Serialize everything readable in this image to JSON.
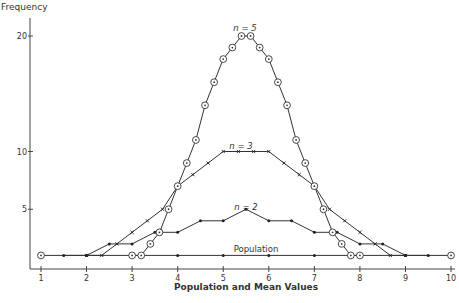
{
  "chart_data": {
    "type": "line",
    "title": "",
    "xlabel": "Population and Mean Values",
    "ylabel": "Frequency",
    "xlim": [
      1,
      10
    ],
    "ylim": [
      0,
      20
    ],
    "x_ticks": [
      1,
      2,
      3,
      4,
      5,
      6,
      7,
      8,
      9,
      10
    ],
    "y_ticks": [
      5,
      10,
      15,
      20
    ],
    "grid": false,
    "legend": "inline labels",
    "series": [
      {
        "name": "Population",
        "marker": "circle-dot",
        "x": [
          1,
          2,
          3,
          4,
          5,
          6,
          7,
          8,
          9,
          10
        ],
        "y": [
          1,
          1,
          1,
          1,
          1,
          1,
          1,
          1,
          1,
          1
        ],
        "label": "Population"
      },
      {
        "name": "n = 2",
        "marker": "dot",
        "x": [
          1.5,
          2,
          2.5,
          3,
          3.5,
          4,
          4.5,
          5,
          5.5,
          6,
          6.5,
          7,
          7.5,
          8,
          8.5,
          9,
          9.5
        ],
        "y": [
          1,
          1,
          2,
          2,
          3,
          3,
          4,
          4,
          5,
          4,
          4,
          3,
          3,
          2,
          2,
          1,
          1
        ],
        "label": "n = 2"
      },
      {
        "name": "n = 3",
        "marker": "cross",
        "x": [
          2,
          2.333,
          2.667,
          3,
          3.333,
          3.667,
          4,
          4.333,
          4.667,
          5,
          5.333,
          5.667,
          6,
          6.333,
          6.667,
          7,
          7.333,
          7.667,
          8,
          8.333,
          8.667,
          9
        ],
        "y": [
          1,
          1,
          2,
          3,
          4,
          5,
          7,
          8,
          9,
          10,
          10,
          10,
          10,
          9,
          8,
          7,
          5,
          4,
          3,
          2,
          1,
          1
        ],
        "label": "n = 3"
      },
      {
        "name": "n = 5",
        "marker": "circle",
        "x": [
          3,
          3.2,
          3.4,
          3.6,
          3.8,
          4,
          4.2,
          4.4,
          4.6,
          4.8,
          5,
          5.2,
          5.4,
          5.6,
          5.8,
          6,
          6.2,
          6.4,
          6.6,
          6.8,
          7,
          7.2,
          7.4,
          7.6,
          7.8,
          8
        ],
        "y": [
          1,
          1,
          2,
          3,
          5,
          7,
          9,
          11,
          14,
          16,
          18,
          19,
          20,
          20,
          19,
          18,
          16,
          14,
          11,
          9,
          7,
          5,
          3,
          2,
          1,
          1
        ],
        "label": "n = 5"
      }
    ]
  },
  "labels": {
    "ylabel": "Frequency",
    "xlabel": "Population and Mean Values",
    "population": "Population",
    "n2": "n = 2",
    "n3": "n = 3",
    "n5": "n = 5"
  }
}
